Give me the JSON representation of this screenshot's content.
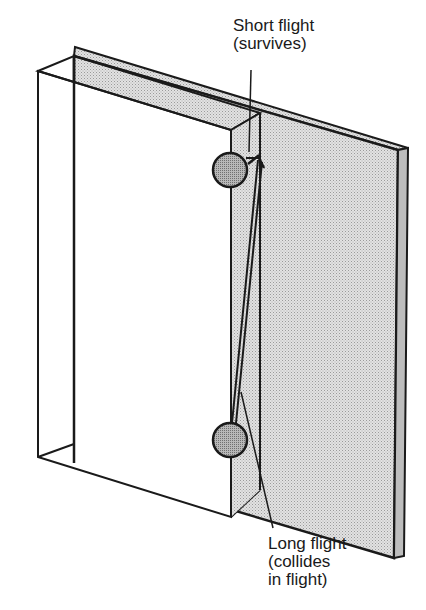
{
  "diagram": {
    "labels": {
      "short_flight": "Short flight\n(survives)",
      "long_flight": "Long flight\n(collides\nin flight)"
    },
    "caption_partial": "",
    "colors": {
      "plate_fill": "#d4d4d4",
      "ball_fill": "#a8a8a8",
      "stroke": "#1a1a1a",
      "background": "#ffffff"
    }
  }
}
